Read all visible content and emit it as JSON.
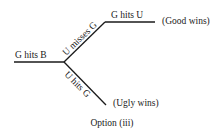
{
  "diagram": {
    "type": "event-tree",
    "root_edge": {
      "label": "G hits B",
      "from": [
        14,
        62
      ],
      "to": [
        64,
        62
      ]
    },
    "branches": [
      {
        "label": "U misses G",
        "from": [
          64,
          62
        ],
        "to": [
          105,
          22
        ],
        "children": [
          {
            "label": "G hits U",
            "from": [
              105,
              22
            ],
            "to": [
              155,
              22
            ],
            "outcome": "(Good wins)"
          }
        ]
      },
      {
        "label": "U hits G",
        "from": [
          64,
          62
        ],
        "to": [
          106,
          105
        ],
        "outcome": "(Ugly wins)"
      }
    ],
    "caption": "Option (iii)",
    "line_color": "#1a1a1a",
    "background": "#ffffff"
  }
}
